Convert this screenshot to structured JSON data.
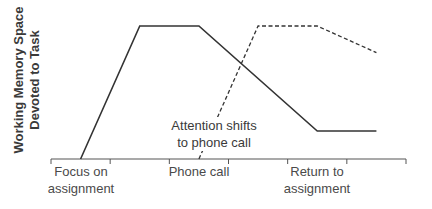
{
  "chart_data": {
    "type": "line",
    "title": "",
    "ylabel": "Working Memory Space Devoted to Task",
    "ylabel_lines": [
      "Working Memory Space",
      "Devoted to Task"
    ],
    "xlabel": "",
    "x_tick_positions": [
      0,
      1,
      2,
      3,
      4,
      5,
      6
    ],
    "x_labels": [
      {
        "at": 0.5,
        "lines": [
          "Focus on",
          "assignment"
        ]
      },
      {
        "at": 2.5,
        "lines": [
          "Phone call"
        ]
      },
      {
        "at": 4.5,
        "lines": [
          "Return to",
          "assignment"
        ]
      }
    ],
    "xlim": [
      0,
      6
    ],
    "ylim": [
      0,
      100
    ],
    "grid": false,
    "series": [
      {
        "name": "Assignment",
        "style": "solid",
        "points": [
          [
            0.5,
            0
          ],
          [
            1.5,
            100
          ],
          [
            2.5,
            100
          ],
          [
            4.5,
            21
          ],
          [
            5.5,
            21
          ]
        ]
      },
      {
        "name": "Phone call",
        "style": "dashed",
        "points": [
          [
            2.5,
            0
          ],
          [
            3.5,
            100
          ],
          [
            4.5,
            100
          ],
          [
            5.5,
            80
          ]
        ]
      }
    ],
    "annotations": [
      {
        "text": "Attention shifts to phone call",
        "lines": [
          "Attention shifts",
          "to phone call"
        ],
        "x": 2.9,
        "y": 20
      }
    ]
  },
  "labels": {
    "ylabel_line1": "Working Memory Space",
    "ylabel_line2": "Devoted to Task",
    "x1_line1": "Focus on",
    "x1_line2": "assignment",
    "x2_line1": "Phone call",
    "x3_line1": "Return to",
    "x3_line2": "assignment",
    "annot_line1": "Attention shifts",
    "annot_line2": "to phone call"
  },
  "colors": {
    "line": "#333333",
    "axis": "#555555",
    "text": "#3a3a3a"
  }
}
